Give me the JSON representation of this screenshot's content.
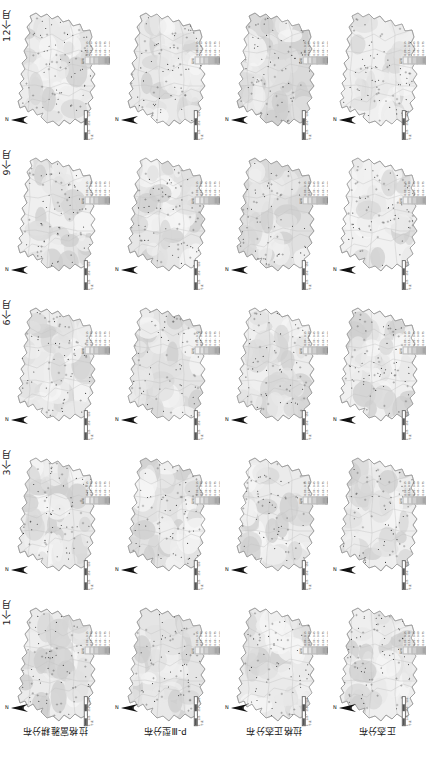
{
  "figure": {
    "type": "map-matrix",
    "rows": 5,
    "cols": 4,
    "background": "#ffffff"
  },
  "row_labels": [
    {
      "id": "ts-12m",
      "label": "12个月"
    },
    {
      "id": "ts-9m",
      "label": "9个月"
    },
    {
      "id": "ts-6m",
      "label": "6个月"
    },
    {
      "id": "ts-3m",
      "label": "3个月"
    },
    {
      "id": "ts-1m",
      "label": "1个月"
    }
  ],
  "col_labels": [
    {
      "id": "dist-loglogistic",
      "label": "拉格富雅耕分布"
    },
    {
      "id": "dist-p3",
      "label": "P-Ⅲ型分布"
    },
    {
      "id": "dist-lognormal",
      "label": "拉格正态分布"
    },
    {
      "id": "dist-normal",
      "label": "正态分布"
    }
  ],
  "legend": {
    "title": "图例",
    "items": [
      {
        "label": "0.00 - 0.15",
        "color": "#f2f2f2"
      },
      {
        "label": "0.15 - 0.30",
        "color": "#e2e2e2"
      },
      {
        "label": "0.30 - 0.45",
        "color": "#d0d0d0"
      },
      {
        "label": "0.45 - 0.60",
        "color": "#bcbcbc"
      },
      {
        "label": "0.60 - 0.75",
        "color": "#a6a6a6"
      },
      {
        "label": "0.75 - 0.90",
        "color": "#8c8c8c"
      }
    ]
  },
  "scalebar": {
    "ticks": [
      "0",
      "125",
      "250",
      "500"
    ],
    "unit": "千米"
  },
  "north_arrow": {
    "label": "N"
  },
  "panel_tints": [
    [
      "#ededed",
      "#e9e9e9",
      "#dadada",
      "#f0f0f0"
    ],
    [
      "#efefef",
      "#e6e6e6",
      "#e0e0e0",
      "#f1f1f1"
    ],
    [
      "#ececec",
      "#e4e4e4",
      "#ededed",
      "#f0f0f0"
    ],
    [
      "#eaeaea",
      "#e2e2e2",
      "#ebebeb",
      "#eeeeee"
    ],
    [
      "#ebebeb",
      "#e5e5e5",
      "#eaeaea",
      "#efefef"
    ]
  ],
  "chart_data": {
    "type": "heatmap",
    "title": "",
    "xlabel": "",
    "ylabel": "",
    "categories": [
      "拉格富雅耕分布",
      "P-Ⅲ型分布",
      "拉格正态分布",
      "正态分布"
    ],
    "series": [
      {
        "name": "12个月",
        "values": [
          0.36,
          0.42,
          0.58,
          0.27
        ]
      },
      {
        "name": "9个月",
        "values": [
          0.33,
          0.47,
          0.5,
          0.25
        ]
      },
      {
        "name": "6个月",
        "values": [
          0.37,
          0.51,
          0.34,
          0.26
        ]
      },
      {
        "name": "3个月",
        "values": [
          0.41,
          0.54,
          0.37,
          0.3
        ]
      },
      {
        "name": "1个月",
        "values": [
          0.39,
          0.49,
          0.4,
          0.28
        ]
      }
    ],
    "legend_position": "panel-top-right",
    "grid": false
  }
}
